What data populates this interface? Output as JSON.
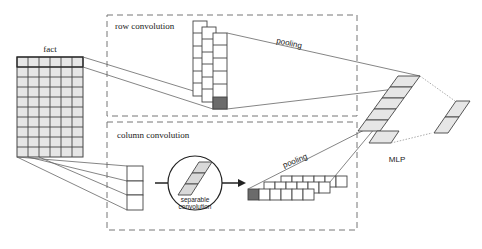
{
  "labels": {
    "fact": "fact",
    "row_convolution": "row convolution",
    "column_convolution": "column convolution",
    "pooling_top": "pooling",
    "pooling_bottom": "pooling",
    "separable_line1": "separable",
    "separable_line2": "convolution",
    "mlp": "MLP"
  },
  "fact_matrix": {
    "rows": 10,
    "cols": 6
  },
  "row_conv_stacks": {
    "count": 3,
    "cells_per_stack": 6
  },
  "column_conv_stacks": {
    "count": 3,
    "cells_per_row": 6
  },
  "column_input_cells": 3,
  "mlp_cells": 6,
  "output_cells": 2,
  "colors": {
    "cell_fill": "#e6e6e6",
    "highlight_fill": "#6b6b6b",
    "line": "#555555",
    "dashed": "#777777"
  }
}
